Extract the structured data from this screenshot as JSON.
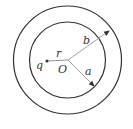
{
  "diagram": {
    "labels": {
      "charge": "q",
      "distance": "r",
      "center": "O",
      "inner_radius": "a",
      "outer_radius": "b"
    },
    "colors": {
      "circle_stroke": "#333333",
      "radius_line": "#999999",
      "text": "#333333"
    }
  }
}
